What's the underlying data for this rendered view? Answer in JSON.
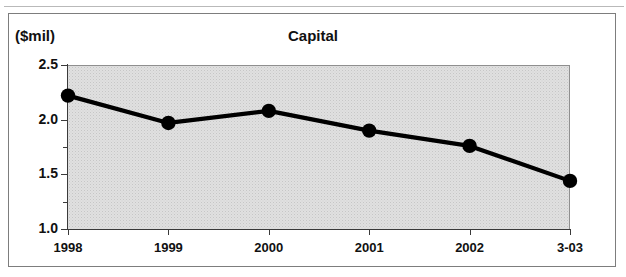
{
  "figure": {
    "unit_label": "($mil)",
    "title": "Capital"
  },
  "chart_data": {
    "type": "line",
    "title": "Capital",
    "subtitle": "",
    "xlabel": "",
    "ylabel": "($mil)",
    "categories": [
      "1998",
      "1999",
      "2000",
      "2001",
      "2002",
      "3-03"
    ],
    "values": [
      2.22,
      1.97,
      2.08,
      1.9,
      1.76,
      1.44
    ],
    "series": [
      {
        "name": "Capital",
        "values": [
          2.22,
          1.97,
          2.08,
          1.9,
          1.76,
          1.44
        ]
      }
    ],
    "ylim": [
      1.0,
      2.5
    ],
    "yticks": [
      "1.0",
      "1.5",
      "2.0",
      "2.5"
    ],
    "ytick_values": [
      1.0,
      1.5,
      2.0,
      2.5
    ],
    "yticks_minor_values": [
      1.25,
      1.75,
      2.25
    ],
    "xticks": [
      "1998",
      "1999",
      "2000",
      "2001",
      "2002",
      "3-03"
    ],
    "grid": false,
    "legend": false,
    "legend_position": "none",
    "marker": "filled-circle",
    "line_color": "#000000",
    "marker_color": "#000000",
    "plot_background": "#e0e0e0",
    "annotations": []
  }
}
